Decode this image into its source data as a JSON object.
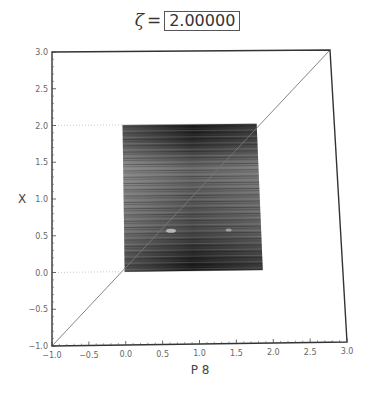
{
  "title": {
    "symbol": "ζ",
    "equals": "=",
    "value": "2.00000"
  },
  "chart_data": {
    "type": "area",
    "xlabel": "P 8",
    "ylabel": "X",
    "xlim": [
      -1.0,
      3.0
    ],
    "ylim": [
      -1.0,
      3.0
    ],
    "xticks": [
      "-1.0",
      "-0.5",
      "0.0",
      "0.5",
      "1.0",
      "1.5",
      "2.0",
      "2.5",
      "3.0"
    ],
    "yticks": [
      "-1.0",
      "-0.5",
      "0.0",
      "0.5",
      "1.0",
      "1.5",
      "2.0",
      "2.5",
      "3.0"
    ],
    "xtick_values": [
      -1.0,
      -0.5,
      0.0,
      0.5,
      1.0,
      1.5,
      2.0,
      2.5,
      3.0
    ],
    "ytick_values": [
      -1.0,
      -0.5,
      0.0,
      0.5,
      1.0,
      1.5,
      2.0,
      2.5,
      3.0
    ],
    "grid": false,
    "series": [
      {
        "name": "identity-line",
        "kind": "line",
        "x": [
          -1.0,
          3.0
        ],
        "y": [
          -1.0,
          3.0
        ]
      },
      {
        "name": "orbit-density-region",
        "kind": "filled-region",
        "x_range": [
          0.0,
          1.9
        ],
        "y_range": [
          0.0,
          2.0
        ],
        "dark_bands": [
          "top edge near X=2.0",
          "bottom edge near X=0.0"
        ]
      },
      {
        "name": "reference-lines",
        "kind": "dotted-hline",
        "y": [
          0.0,
          2.0
        ],
        "x_range": [
          -1.0,
          0.0
        ]
      }
    ]
  }
}
